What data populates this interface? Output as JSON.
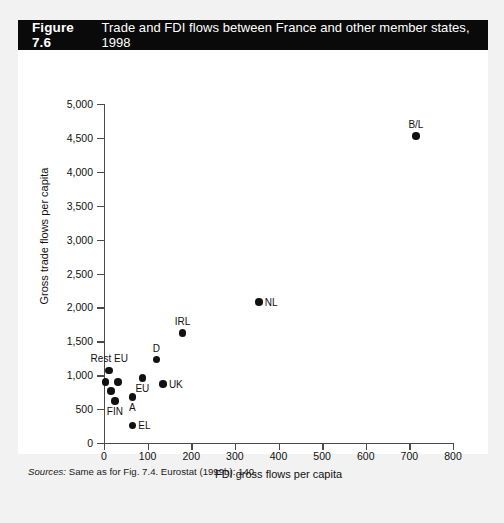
{
  "figure": {
    "number": "Figure 7.6",
    "title": "Trade and FDI flows between France and other member states, 1998",
    "sources_label": "Sources:",
    "sources_text": " Same as for Fig. 7.4. Eurostat (1999b): 140."
  },
  "chart_data": {
    "type": "scatter",
    "title": "Trade and FDI flows between France and other member states, 1998",
    "xlabel": "FDI gross flows per capita",
    "ylabel": "Gross trade flows per capita",
    "xlim": [
      0,
      800
    ],
    "ylim": [
      0,
      5000
    ],
    "xticks": [
      0,
      100,
      200,
      300,
      400,
      500,
      600,
      700,
      800
    ],
    "yticks": [
      0,
      500,
      1000,
      1500,
      2000,
      2500,
      3000,
      3500,
      4000,
      4500,
      5000
    ],
    "xtick_labels": [
      "0",
      "100",
      "200",
      "300",
      "400",
      "500",
      "600",
      "700",
      "800"
    ],
    "ytick_labels": [
      "0",
      "500",
      "1,000",
      "1,500",
      "2,000",
      "2,500",
      "3,000",
      "3,500",
      "4,000",
      "4,500",
      "5,000"
    ],
    "grid": false,
    "legend": false,
    "marker_color": "#111111",
    "points": [
      {
        "label": "B/L",
        "x": 715,
        "y": 4530,
        "label_pos": "above"
      },
      {
        "label": "NL",
        "x": 355,
        "y": 2080,
        "label_pos": "right"
      },
      {
        "label": "IRL",
        "x": 180,
        "y": 1620,
        "label_pos": "above"
      },
      {
        "label": "D",
        "x": 120,
        "y": 1230,
        "label_pos": "above"
      },
      {
        "label": "Rest EU",
        "x": 12,
        "y": 1070,
        "label_pos": "above"
      },
      {
        "label": "",
        "x": 3,
        "y": 900,
        "label_pos": "none"
      },
      {
        "label": "",
        "x": 32,
        "y": 900,
        "label_pos": "none"
      },
      {
        "label": "",
        "x": 16,
        "y": 770,
        "label_pos": "none"
      },
      {
        "label": "EU",
        "x": 88,
        "y": 960,
        "label_pos": "below"
      },
      {
        "label": "UK",
        "x": 135,
        "y": 870,
        "label_pos": "right"
      },
      {
        "label": "A",
        "x": 65,
        "y": 680,
        "label_pos": "below"
      },
      {
        "label": "FIN",
        "x": 25,
        "y": 620,
        "label_pos": "below"
      },
      {
        "label": "EL",
        "x": 65,
        "y": 260,
        "label_pos": "right"
      }
    ]
  }
}
